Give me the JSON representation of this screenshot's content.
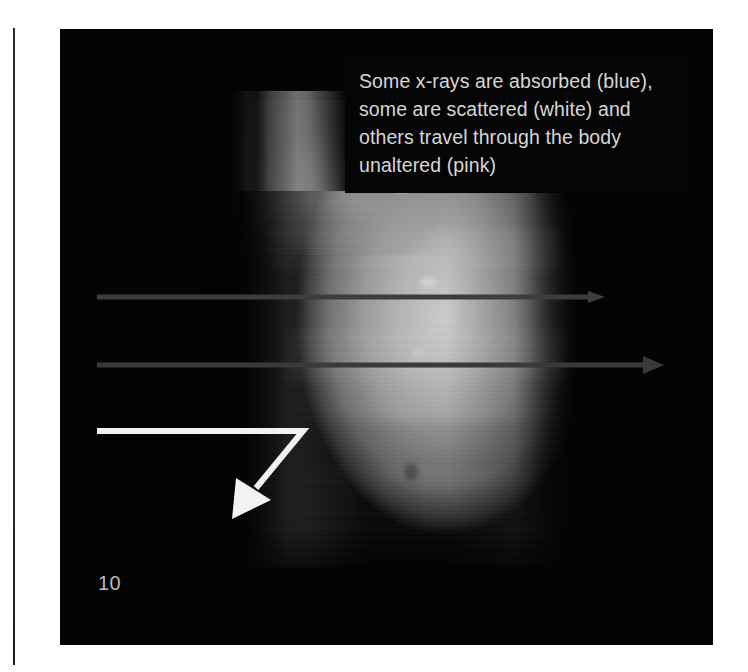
{
  "page": {
    "number": "10",
    "background_color": "#ffffff",
    "panel_color": "#040404"
  },
  "caption": {
    "text_color": "#d6d6d6",
    "lines": [
      "Some x-rays are absorbed (blue),",
      "some are scattered (white) and",
      "others travel through the body",
      "unaltered (pink)"
    ],
    "full_text": "Some x-rays are absorbed (blue), some are scattered (white) and others travel through the body unaltered (pink)"
  },
  "figure": {
    "type": "radiographic-torso-scan"
  },
  "annotations": {
    "arrows": [
      {
        "name": "absorbed-ray-arrow",
        "meaning": "absorbed",
        "legend_color_name": "blue",
        "rendered_color": "#3c3c3c",
        "direction": "right",
        "x_start": 37,
        "x_end": 535,
        "y": 268
      },
      {
        "name": "scattered-ray-arrow",
        "meaning": "scattered",
        "legend_color_name": "white",
        "rendered_color": "#3a3a3a",
        "direction": "right",
        "x_start": 37,
        "x_end": 597,
        "y": 336
      },
      {
        "name": "unaltered-ray-arrow",
        "meaning": "unaltered / travels through",
        "legend_color_name": "pink",
        "rendered_color": "#f2f2f2",
        "direction": "down-left-elbow",
        "x_start": 37,
        "x_elbow": 243,
        "y": 402,
        "tip_x": 190,
        "tip_y": 466
      }
    ]
  }
}
